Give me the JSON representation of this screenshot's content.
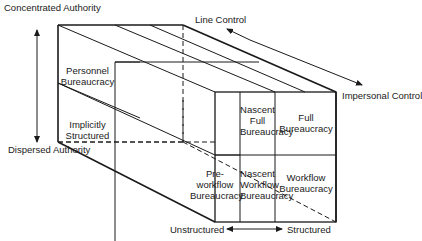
{
  "diagram": {
    "type": "3d-cube-typology",
    "axes": {
      "vertical": {
        "top": "Concentrated Authority",
        "bottom": "Dispersed Authority"
      },
      "depth": {
        "back": "Line Control",
        "front": "Impersonal Control"
      },
      "horizontal": {
        "left": "Unstructured",
        "right": "Structured"
      }
    },
    "cells": {
      "personnel_bureaucracy": [
        "Personnel",
        "Bureaucracy"
      ],
      "implicitly_structured": [
        "Implicitly",
        "Structured"
      ],
      "nascent_full_bureaucracy": [
        "Nascent",
        "Full",
        "Bureaucracy"
      ],
      "full_bureaucracy": [
        "Full",
        "Bureaucracy"
      ],
      "pre_workflow_bureaucracy": [
        "Pre-",
        "workflow",
        "Bureaucracy"
      ],
      "nascent_workflow_bureaucracy": [
        "Nascent",
        "Workflow",
        "Bureaucracy"
      ],
      "workflow_bureaucracy": [
        "Workflow",
        "Bureaucracy"
      ]
    },
    "colors": {
      "line": "#1a1a1a",
      "background": "#ffffff"
    }
  }
}
